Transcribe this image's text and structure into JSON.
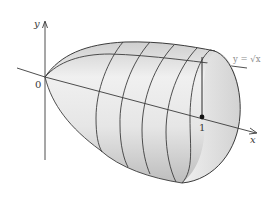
{
  "figure": {
    "labels": {
      "y_axis": "y",
      "x_axis": "x",
      "origin": "0",
      "x_tick": "1",
      "curve_equation": "y = √x"
    },
    "colors": {
      "axis": "#3a3a3a",
      "outline": "#3c3c3c",
      "fill_light": "#f4f4f4",
      "fill_dark": "#c8c8c8",
      "equation_text": "#8a8a8a"
    },
    "cross_sections": 4
  }
}
